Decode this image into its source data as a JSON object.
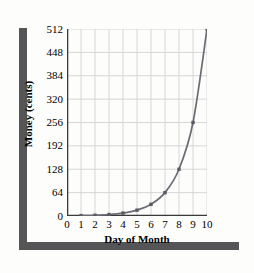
{
  "chart_data": {
    "type": "line",
    "title": "",
    "xlabel": "Day of Month",
    "ylabel": "Money (cents)",
    "x": [
      1,
      2,
      3,
      4,
      5,
      6,
      7,
      8,
      9,
      10
    ],
    "values": [
      1,
      2,
      4,
      8,
      16,
      32,
      64,
      128,
      256,
      512
    ],
    "series": [
      {
        "name": "Money (cents)",
        "values": [
          1,
          2,
          4,
          8,
          16,
          32,
          64,
          128,
          256,
          512
        ]
      }
    ],
    "xticks": [
      "0",
      "1",
      "2",
      "3",
      "4",
      "5",
      "6",
      "7",
      "8",
      "9",
      "10"
    ],
    "xtick_values": [
      0,
      1,
      2,
      3,
      4,
      5,
      6,
      7,
      8,
      9,
      10
    ],
    "yticks": [
      "0",
      "64",
      "128",
      "192",
      "256",
      "320",
      "384",
      "448",
      "512"
    ],
    "ytick_values": [
      0,
      64,
      128,
      192,
      256,
      320,
      384,
      448,
      512
    ],
    "xlim": [
      0,
      10
    ],
    "ylim": [
      0,
      512
    ],
    "grid": true,
    "legend": false,
    "marker": "square",
    "line_color": "#6b6b73",
    "marker_color": "#5a5a63",
    "grid_color": "#d6d6d6",
    "axis_color": "#3a3a3a"
  },
  "decor": {
    "frame_color": "#555558",
    "background_color": "#ffffff"
  }
}
